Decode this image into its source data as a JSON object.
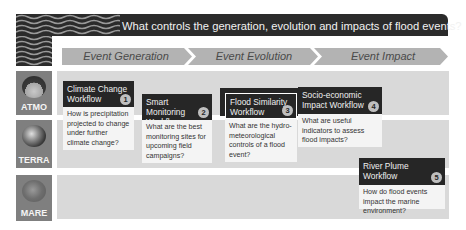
{
  "header": {
    "title": "What controls the generation, evolution and impacts of flood events?"
  },
  "phases": [
    {
      "label": "Event Generation"
    },
    {
      "label": "Event Evolution"
    },
    {
      "label": "Event Impact"
    }
  ],
  "rows": [
    {
      "label": "ATMO",
      "icon": "atmosphere-globe-icon"
    },
    {
      "label": "TERRA",
      "icon": "earth-globe-icon"
    },
    {
      "label": "MARE",
      "icon": "ocean-globe-icon"
    }
  ],
  "workflows": [
    {
      "number": "1",
      "title": "Climate Change Workflow",
      "question": "How is precipitation projected to change under further climate change?"
    },
    {
      "number": "2",
      "title": "Smart Monitoring Workflow",
      "question": "What are the best monitoring sites for upcoming field campaigns?"
    },
    {
      "number": "3",
      "title": "Flood Similarity Workflow",
      "question": "What are the hydro-meteorological controls of a flood event?"
    },
    {
      "number": "4",
      "title": "Socio-economic Impact Workflow",
      "question": "What are useful indicators to assess flood impacts?"
    },
    {
      "number": "5",
      "title": "River Plume Workflow",
      "question": "How do flood events impact the marine environment?"
    }
  ],
  "colors": {
    "header_bg": "#2b2b2b",
    "band_bg": "#d9d9d9",
    "banner_bg": "#b3b3b3",
    "row_badge_bg": "#7f7f7f",
    "card_head_bg": "#262626",
    "card_body_bg": "#f4f4f4"
  }
}
